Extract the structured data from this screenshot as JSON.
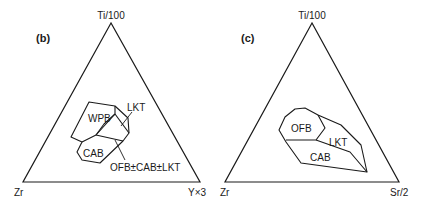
{
  "diagram_b": {
    "panel_label": "(b)",
    "apex_top": "Ti/100",
    "apex_left": "Zr",
    "apex_right": "Y×3",
    "fields": {
      "wpb": "WPB",
      "lkt": "LKT",
      "cab": "CAB",
      "ofb_cab_lkt": "OFB±CAB±LKT"
    }
  },
  "diagram_c": {
    "panel_label": "(c)",
    "apex_top": "Ti/100",
    "apex_left": "Zr",
    "apex_right": "Sr/2",
    "fields": {
      "ofb": "OFB",
      "lkt": "LKT",
      "cab": "CAB"
    }
  }
}
